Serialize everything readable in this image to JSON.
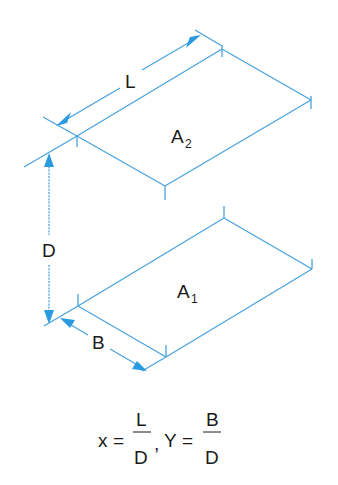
{
  "diagram": {
    "labels": {
      "length": "L",
      "width": "B",
      "distance": "D",
      "area_top": "A",
      "area_top_sub": "2",
      "area_bottom": "A",
      "area_bottom_sub": "1"
    },
    "formula": {
      "x_var": "x",
      "equals": "=",
      "x_num": "L",
      "x_den": "D",
      "comma": ",",
      "y_var": "Y",
      "y_num": "B",
      "y_den": "D"
    },
    "colors": {
      "line": "#4aa3df",
      "arrow": "#2a9be0",
      "text": "#1a1a1a"
    }
  }
}
